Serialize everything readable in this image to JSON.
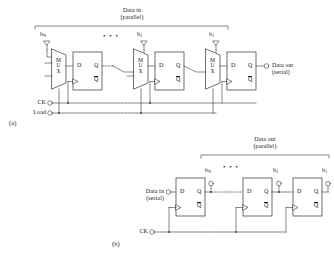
{
  "figure": {
    "caption_a": "(a)",
    "caption_b": "(b)"
  },
  "colors": {
    "line": "#555555",
    "box_stroke": "#4a4a4a",
    "text": "#1a1a1a",
    "background": "#ffffff"
  },
  "part_a": {
    "title": "parallel-in serial-out shift register",
    "data_in_label_line1": "Data in",
    "data_in_label_line2": "(parallel)",
    "data_out_label_line1": "Data out",
    "data_out_label_line2": "(serial)",
    "ellipsis": "• • •",
    "inputs": [
      {
        "name": "b",
        "subscript": "N"
      },
      {
        "name": "b",
        "subscript": "2"
      },
      {
        "name": "b",
        "subscript": "1"
      }
    ],
    "control_signals": [
      {
        "label": "CK"
      },
      {
        "label": "Load"
      }
    ],
    "mux_label_letters": [
      "M",
      "U",
      "X"
    ],
    "flipflops": [
      {
        "d": "D",
        "q": "Q",
        "qbar": "Q"
      },
      {
        "d": "D",
        "q": "Q",
        "qbar": "Q"
      },
      {
        "d": "D",
        "q": "Q",
        "qbar": "Q"
      }
    ]
  },
  "part_b": {
    "title": "serial-in parallel-out shift register",
    "data_in_label_line1": "Data in",
    "data_in_label_line2": "(serial)",
    "data_out_label_line1": "Data out",
    "data_out_label_line2": "(parallel)",
    "ellipsis": "• • •",
    "outputs": [
      {
        "name": "b",
        "subscript": "N"
      },
      {
        "name": "b",
        "subscript": "2"
      },
      {
        "name": "b",
        "subscript": "1"
      }
    ],
    "control_signals": [
      {
        "label": "CK"
      }
    ],
    "flipflops": [
      {
        "d": "D",
        "q": "Q",
        "qbar": "Q"
      },
      {
        "d": "D",
        "q": "Q",
        "qbar": "Q"
      },
      {
        "d": "D",
        "q": "Q",
        "qbar": "Q"
      }
    ]
  }
}
